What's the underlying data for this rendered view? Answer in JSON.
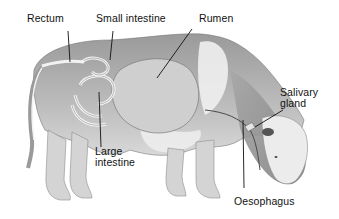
{
  "diagram": {
    "labels": {
      "rectum": "Rectum",
      "small_intestine": "Small intestine",
      "rumen": "Rumen",
      "salivary_gland_line1": "Salivary",
      "salivary_gland_line2": "gland",
      "large_intestine_line1": "Large",
      "large_intestine_line2": "intestine",
      "oesophagus": "Oesophagus"
    },
    "colors": {
      "background": "#ffffff",
      "body_dark": "#8a8a8a",
      "body_mid": "#b5b5b5",
      "body_light": "#e6e6e6",
      "leader_line": "#111111"
    }
  }
}
